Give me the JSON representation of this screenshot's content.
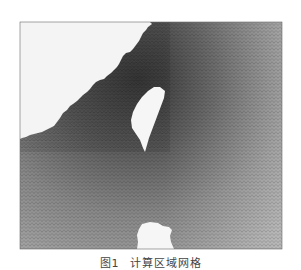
{
  "figure": {
    "number": "图1",
    "caption": "计算区域网格",
    "regions": {
      "mainland_land": "white (upper-left)",
      "taiwan_island": "white (center)",
      "luzon_island": "white (bottom center)",
      "ocean_mesh": "gray triangular mesh, denser/darker near the coast and strait"
    },
    "colors": {
      "land": "#f4f4f4",
      "mesh_dense": "#4a4a4a",
      "mesh_mid": "#7a7a7a",
      "mesh_sparse": "#a8a8a8",
      "frame": "#555555"
    }
  }
}
